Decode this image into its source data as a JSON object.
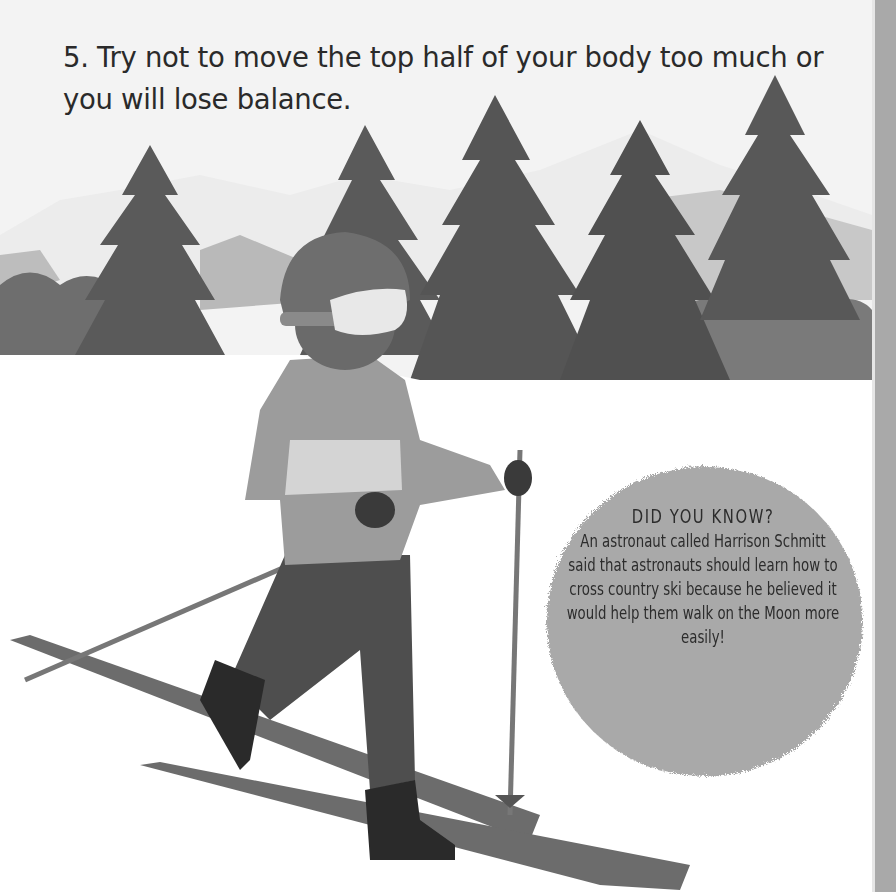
{
  "page": {
    "instruction": "5. Try not to move the top half of your body too much or you will lose balance.",
    "fact_box": {
      "title": "DID YOU KNOW?",
      "body": "An astronaut called Harrison Schmitt said that astronauts should learn how to cross country ski because he believed it would help them walk on the Moon more easily!"
    },
    "illustration": {
      "subject": "child cross-country skiing in snowy pine forest",
      "colors": {
        "background": "#f3f3f3",
        "snow": "#ffffff",
        "trees": "#5e5e5e",
        "mountains": "#b8b8b8",
        "bubble": "#a8a8a8",
        "jacket": "#9a9a9a",
        "pants": "#4f4f4f",
        "boots": "#2a2a2a"
      }
    }
  }
}
